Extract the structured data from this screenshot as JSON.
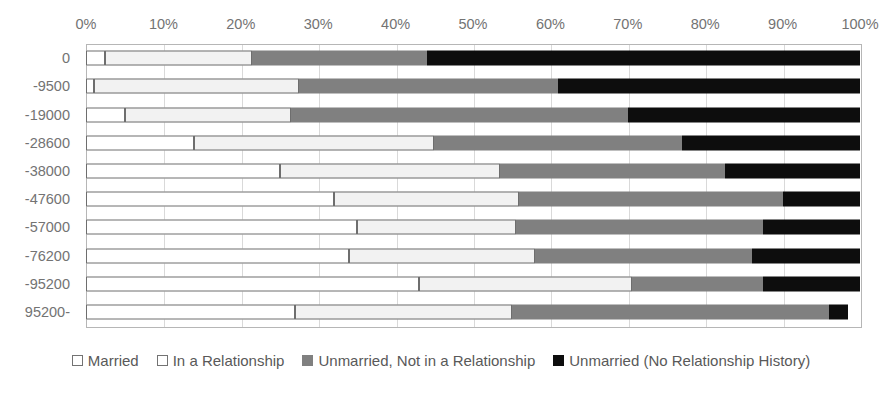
{
  "chart_data": {
    "type": "bar",
    "orientation": "horizontal",
    "stacked": true,
    "normalized": true,
    "title": "",
    "xlabel": "",
    "ylabel": "",
    "xlim": [
      0,
      100
    ],
    "xtick_labels": [
      "0%",
      "10%",
      "20%",
      "30%",
      "40%",
      "50%",
      "60%",
      "70%",
      "80%",
      "90%",
      "100%"
    ],
    "xtick_values": [
      0,
      10,
      20,
      30,
      40,
      50,
      60,
      70,
      80,
      90,
      100
    ],
    "grid": "vertical",
    "legend_position": "bottom",
    "categories": [
      "0",
      "-9500",
      "-19000",
      "-28600",
      "-38000",
      "-47600",
      "-57000",
      "-76200",
      "-95200",
      "95200-"
    ],
    "series": [
      {
        "name": "Married",
        "color": "#ffffff",
        "values": [
          2.5,
          1.0,
          5.0,
          14.0,
          25.0,
          32.0,
          35.0,
          34.0,
          43.0,
          27.0
        ]
      },
      {
        "name": "In a Relationship",
        "color": "#f2f2f2",
        "values": [
          19.0,
          26.5,
          21.5,
          31.0,
          28.5,
          24.0,
          20.5,
          24.0,
          27.5,
          28.0
        ]
      },
      {
        "name": "Unmarried, Not in a Relationship",
        "color": "#808080",
        "values": [
          22.5,
          33.5,
          43.5,
          32.0,
          29.0,
          34.0,
          32.0,
          28.0,
          17.0,
          41.0
        ]
      },
      {
        "name": "Unmarried (No Relationship History)",
        "color": "#0d0d0d",
        "values": [
          56.0,
          39.0,
          30.0,
          23.0,
          17.5,
          10.0,
          12.5,
          14.0,
          12.5,
          2.5
        ]
      }
    ],
    "cumulative_boundaries": [
      [
        2.5,
        21.5,
        44.0,
        100.0
      ],
      [
        1.0,
        27.5,
        61.0,
        100.0
      ],
      [
        5.0,
        26.5,
        70.0,
        100.0
      ],
      [
        14.0,
        45.0,
        77.0,
        100.0
      ],
      [
        25.0,
        53.5,
        82.5,
        100.0
      ],
      [
        32.0,
        56.0,
        90.0,
        100.0
      ],
      [
        35.0,
        55.5,
        87.5,
        100.0
      ],
      [
        34.0,
        58.0,
        86.0,
        100.0
      ],
      [
        43.0,
        70.5,
        87.5,
        100.0
      ],
      [
        27.0,
        55.0,
        96.0,
        98.5
      ]
    ]
  },
  "legend": {
    "items": [
      {
        "label": "Married"
      },
      {
        "label": "In a Relationship"
      },
      {
        "label": "Unmarried, Not in a Relationship"
      },
      {
        "label": "Unmarried (No Relationship History)"
      }
    ]
  }
}
